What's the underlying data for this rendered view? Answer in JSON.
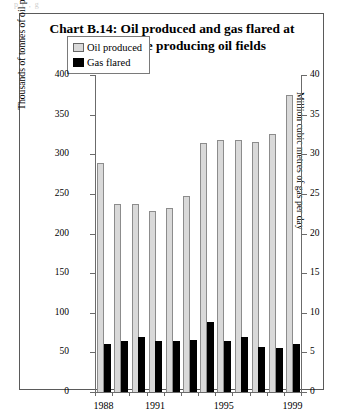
{
  "page": {
    "cut_off_top_text": "p                 (                 ,  g"
  },
  "chart_data": {
    "type": "bar",
    "title": "Chart B.14:  Oil produced and gas flared at offshore producing oil fields",
    "title_line1": "Chart B.14:  Oil produced and gas flared at",
    "title_line2": "offshore producing oil fields",
    "categories": [
      "1988",
      "1989",
      "1990",
      "1991",
      "1992",
      "1993",
      "1994",
      "1995",
      "1996",
      "1997",
      "1998",
      "1999"
    ],
    "x_tick_labels": [
      "1988",
      "1991",
      "1995",
      "1999"
    ],
    "x_tick_label_index": [
      0,
      3,
      7,
      11
    ],
    "xlabel": "",
    "ylabel": "Thousands of tonnes of oil per day",
    "ylabel_right": "Million cubic metres of gas per day",
    "ylim": [
      0,
      400
    ],
    "ylim_right": [
      0,
      40
    ],
    "yticks": [
      0,
      50,
      100,
      150,
      200,
      250,
      300,
      350,
      400
    ],
    "yticks_right": [
      0,
      5,
      10,
      15,
      20,
      25,
      30,
      35,
      40
    ],
    "grid": false,
    "legend_position": "top-center",
    "series": [
      {
        "name": "Oil produced",
        "axis": "left",
        "color": "#d9d9d9",
        "values": [
          289,
          237,
          237,
          228,
          232,
          247,
          314,
          318,
          318,
          315,
          325,
          375
        ]
      },
      {
        "name": "Gas flared",
        "axis": "right",
        "color": "#000000",
        "values": [
          6.1,
          6.5,
          7.0,
          6.5,
          6.5,
          6.6,
          8.8,
          6.4,
          7.0,
          5.7,
          5.6,
          6.0
        ]
      }
    ]
  }
}
